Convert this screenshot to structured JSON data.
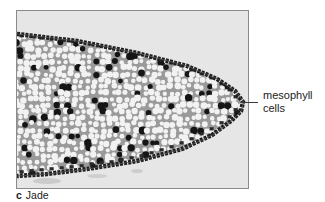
{
  "figure": {
    "panel_letter": "c",
    "caption": "Jade",
    "image_description": "Light micrograph of a jade leaf cross-section tip showing mesophyll cells",
    "annotation": {
      "line1": "mesophyll",
      "line2": "cells"
    },
    "colors": {
      "background": "#e4e4e4",
      "tissue_matrix": "#9a9a9a",
      "vacuole": "#f2f2f2",
      "dark_cell": "#151515",
      "epidermis": "#2a2a2a",
      "text": "#222222"
    }
  }
}
